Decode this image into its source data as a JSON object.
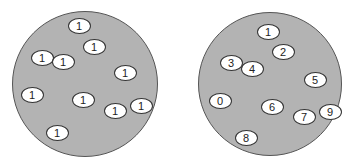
{
  "colors": {
    "dish_fill": "#b3b3b3",
    "dish_border": "#555555",
    "cell_fill": "#ffffff",
    "cell_border": "#333333"
  },
  "dishes": [
    {
      "name": "left-dish",
      "cx": 85,
      "cy": 84,
      "r": 73,
      "cells": [
        {
          "label": "1",
          "x": 79,
          "y": 26
        },
        {
          "label": "1",
          "x": 94,
          "y": 47
        },
        {
          "label": "1",
          "x": 42,
          "y": 58
        },
        {
          "label": "1",
          "x": 63,
          "y": 62
        },
        {
          "label": "1",
          "x": 125,
          "y": 73
        },
        {
          "label": "1",
          "x": 32,
          "y": 95
        },
        {
          "label": "1",
          "x": 83,
          "y": 100
        },
        {
          "label": "1",
          "x": 115,
          "y": 111
        },
        {
          "label": "1",
          "x": 141,
          "y": 106
        },
        {
          "label": "1",
          "x": 57,
          "y": 133
        }
      ]
    },
    {
      "name": "right-dish",
      "cx": 270,
      "cy": 84,
      "r": 72,
      "cells": [
        {
          "label": "1",
          "x": 268,
          "y": 32
        },
        {
          "label": "2",
          "x": 283,
          "y": 52
        },
        {
          "label": "3",
          "x": 231,
          "y": 63
        },
        {
          "label": "4",
          "x": 252,
          "y": 69
        },
        {
          "label": "5",
          "x": 315,
          "y": 80
        },
        {
          "label": "0",
          "x": 220,
          "y": 101
        },
        {
          "label": "6",
          "x": 272,
          "y": 107
        },
        {
          "label": "7",
          "x": 304,
          "y": 117
        },
        {
          "label": "9",
          "x": 330,
          "y": 112
        },
        {
          "label": "8",
          "x": 246,
          "y": 138
        }
      ]
    }
  ]
}
